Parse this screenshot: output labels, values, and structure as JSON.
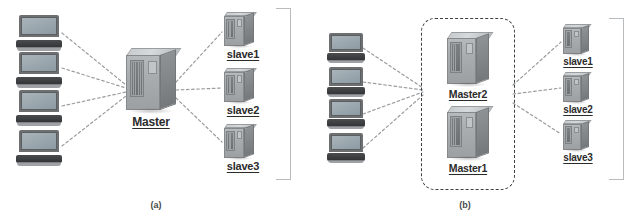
{
  "figure": {
    "background_color": "#ffffff",
    "accent_color": "#9a9da0",
    "label_color": "#2b2b2b"
  },
  "panel_a": {
    "caption": "(a)",
    "clients": [
      {
        "name": "laptop-1"
      },
      {
        "name": "laptop-2"
      },
      {
        "name": "laptop-3"
      },
      {
        "name": "laptop-4"
      }
    ],
    "master": {
      "label": "Master",
      "icon": "server-tower-icon"
    },
    "slaves": [
      {
        "label": "slave1",
        "icon": "server-tower-icon"
      },
      {
        "label": "slave2",
        "icon": "server-tower-icon"
      },
      {
        "label": "slave3",
        "icon": "server-tower-icon"
      }
    ],
    "bracket": "right-brace-bracket"
  },
  "panel_b": {
    "caption": "(b)",
    "clients": [
      {
        "name": "laptop-1"
      },
      {
        "name": "laptop-2"
      },
      {
        "name": "laptop-3"
      },
      {
        "name": "laptop-4"
      }
    ],
    "master_group": {
      "outline": "dashed-rounded-rectangle",
      "masters": [
        {
          "label": "Master2",
          "icon": "server-tower-icon"
        },
        {
          "label": "Master1",
          "icon": "server-tower-icon"
        }
      ]
    },
    "slaves": [
      {
        "label": "slave1",
        "icon": "server-tower-icon"
      },
      {
        "label": "slave2",
        "icon": "server-tower-icon"
      },
      {
        "label": "slave3",
        "icon": "server-tower-icon"
      }
    ],
    "bracket": "right-brace-bracket"
  }
}
